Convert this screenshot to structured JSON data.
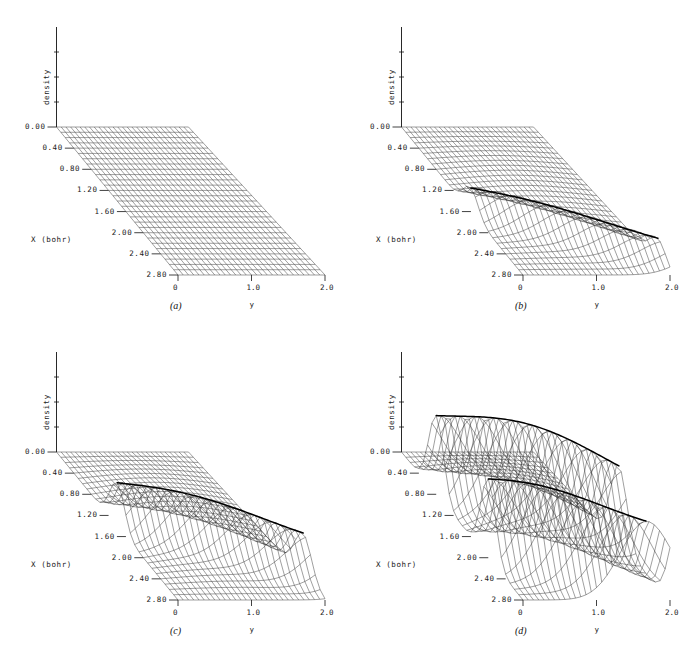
{
  "figure": {
    "kind": "four-panel 3d mesh surface plot",
    "panel_count": 4
  },
  "axes": {
    "vertical_label": "density",
    "depth_label": "X (bohr)",
    "horizontal_label": "y",
    "x_ticks": [
      "0.00",
      "0.40",
      "0.80",
      "1.20",
      "1.60",
      "2.00",
      "2.40",
      "2.80"
    ],
    "y_ticks": [
      "0",
      "1.0",
      "2.0"
    ]
  },
  "panels": [
    {
      "caption": "(a)",
      "amplitude": 0.0,
      "ridges": 0,
      "ridge_rows": []
    },
    {
      "caption": "(b)",
      "amplitude": 0.3,
      "ridges": 1,
      "ridge_rows": [
        16
      ]
    },
    {
      "caption": "(c)",
      "amplitude": 0.55,
      "ridges": 1,
      "ridge_rows": [
        14
      ]
    },
    {
      "caption": "(d)",
      "amplitude": 1.0,
      "ridges": 2,
      "ridge_rows": [
        8,
        20
      ]
    }
  ],
  "chart_data": {
    "type": "line",
    "title": "",
    "xlabel": "y",
    "ylabel": "density",
    "zlabel": "X (bohr)",
    "xlim": [
      0,
      2.0
    ],
    "zlim": [
      0.0,
      2.8
    ],
    "grid": true,
    "legend": "none",
    "series": [
      {
        "name": "(a)",
        "peak_density": 0.0,
        "wave_count": 0,
        "description": "flat featureless sheet, no density modulation"
      },
      {
        "name": "(b)",
        "peak_density": 0.3,
        "wave_count": 1,
        "description": "single shallow broad undulation across the X direction"
      },
      {
        "name": "(c)",
        "peak_density": 0.55,
        "wave_count": 1,
        "description": "single sharp diagonal ridge from upper-left to lower-right"
      },
      {
        "name": "(d)",
        "peak_density": 1.0,
        "wave_count": 2,
        "description": "two strong S-shaped ridges, highest amplitude oscillation"
      }
    ],
    "x_tick_values": [
      0,
      1.0,
      2.0
    ],
    "z_tick_values": [
      0.0,
      0.4,
      0.8,
      1.2,
      1.6,
      2.0,
      2.4,
      2.8
    ]
  }
}
